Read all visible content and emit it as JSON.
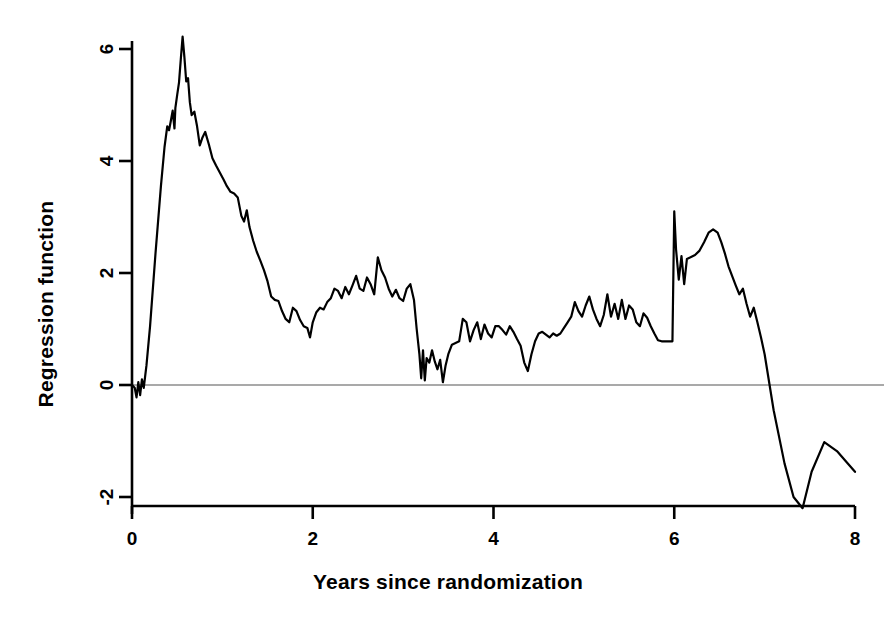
{
  "chart_data": {
    "type": "line",
    "title": "",
    "subtitle": "",
    "xlabel": "Years since randomization",
    "ylabel": "Regression function",
    "xlim": [
      0,
      8
    ],
    "ylim": [
      -2.45,
      6.45
    ],
    "xticks": [
      0,
      2,
      4,
      6,
      8
    ],
    "xtick_labels": [
      "0",
      "2",
      "4",
      "6",
      "8"
    ],
    "yticks": [
      -2,
      0,
      2,
      4,
      6
    ],
    "ytick_labels": [
      "-2",
      "0",
      "2",
      "4",
      "6"
    ],
    "grid": false,
    "legend": null,
    "legend_position": "none",
    "annotations": [
      {
        "text": "horizontal reference line at y = 0",
        "y": 0
      }
    ],
    "reference_lines": [
      {
        "orientation": "horizontal",
        "value": 0,
        "color": "#555555",
        "width": 1
      }
    ],
    "series": [
      {
        "name": "Regression function",
        "color": "#000000",
        "line_width": 2.2,
        "x": [
          0.0,
          0.03,
          0.05,
          0.07,
          0.09,
          0.11,
          0.13,
          0.16,
          0.2,
          0.26,
          0.32,
          0.36,
          0.39,
          0.41,
          0.43,
          0.45,
          0.47,
          0.48,
          0.5,
          0.52,
          0.54,
          0.56,
          0.58,
          0.6,
          0.62,
          0.64,
          0.66,
          0.69,
          0.72,
          0.75,
          0.78,
          0.81,
          0.85,
          0.89,
          0.93,
          0.97,
          1.01,
          1.05,
          1.09,
          1.13,
          1.17,
          1.21,
          1.24,
          1.27,
          1.3,
          1.34,
          1.38,
          1.42,
          1.46,
          1.5,
          1.54,
          1.58,
          1.62,
          1.66,
          1.7,
          1.74,
          1.78,
          1.82,
          1.86,
          1.9,
          1.94,
          1.97,
          2.0,
          2.04,
          2.08,
          2.12,
          2.16,
          2.2,
          2.24,
          2.28,
          2.32,
          2.36,
          2.4,
          2.44,
          2.48,
          2.52,
          2.56,
          2.6,
          2.64,
          2.68,
          2.72,
          2.76,
          2.8,
          2.84,
          2.88,
          2.92,
          2.96,
          3.0,
          3.04,
          3.08,
          3.12,
          3.15,
          3.18,
          3.2,
          3.22,
          3.24,
          3.26,
          3.29,
          3.32,
          3.35,
          3.38,
          3.41,
          3.44,
          3.47,
          3.5,
          3.54,
          3.58,
          3.62,
          3.66,
          3.7,
          3.74,
          3.78,
          3.82,
          3.86,
          3.9,
          3.94,
          3.98,
          4.02,
          4.06,
          4.1,
          4.14,
          4.18,
          4.22,
          4.26,
          4.3,
          4.34,
          4.38,
          4.42,
          4.46,
          4.5,
          4.54,
          4.58,
          4.62,
          4.66,
          4.7,
          4.74,
          4.78,
          4.82,
          4.86,
          4.9,
          4.94,
          4.98,
          5.02,
          5.06,
          5.1,
          5.14,
          5.18,
          5.22,
          5.26,
          5.3,
          5.34,
          5.38,
          5.42,
          5.46,
          5.5,
          5.54,
          5.58,
          5.62,
          5.66,
          5.7,
          5.74,
          5.78,
          5.82,
          5.86,
          5.9,
          5.94,
          5.98,
          6.0,
          6.02,
          6.05,
          6.08,
          6.11,
          6.14,
          6.18,
          6.23,
          6.28,
          6.33,
          6.38,
          6.43,
          6.48,
          6.52,
          6.56,
          6.6,
          6.64,
          6.68,
          6.72,
          6.76,
          6.8,
          6.84,
          6.88,
          6.92,
          6.96,
          7.0,
          7.1,
          7.22,
          7.32,
          7.42,
          7.52,
          7.66,
          7.8,
          7.92,
          8.0
        ],
        "y": [
          0.0,
          -0.05,
          -0.22,
          0.05,
          -0.18,
          0.1,
          -0.05,
          0.35,
          1.05,
          2.35,
          3.55,
          4.25,
          4.62,
          4.55,
          4.72,
          4.9,
          4.58,
          4.95,
          5.18,
          5.4,
          5.82,
          6.22,
          5.85,
          5.42,
          5.48,
          5.05,
          4.82,
          4.88,
          4.62,
          4.28,
          4.42,
          4.52,
          4.3,
          4.05,
          3.92,
          3.8,
          3.68,
          3.55,
          3.45,
          3.42,
          3.35,
          3.02,
          2.92,
          3.12,
          2.82,
          2.58,
          2.38,
          2.22,
          2.05,
          1.85,
          1.58,
          1.52,
          1.5,
          1.32,
          1.18,
          1.12,
          1.38,
          1.32,
          1.16,
          1.05,
          1.02,
          0.85,
          1.12,
          1.3,
          1.38,
          1.35,
          1.48,
          1.55,
          1.72,
          1.68,
          1.55,
          1.75,
          1.62,
          1.78,
          1.95,
          1.72,
          1.68,
          1.92,
          1.8,
          1.62,
          2.28,
          2.05,
          1.92,
          1.72,
          1.58,
          1.7,
          1.55,
          1.5,
          1.72,
          1.8,
          1.52,
          1.0,
          0.55,
          0.12,
          0.62,
          0.08,
          0.48,
          0.4,
          0.62,
          0.42,
          0.28,
          0.45,
          0.05,
          0.35,
          0.55,
          0.72,
          0.75,
          0.78,
          1.18,
          1.12,
          0.78,
          0.98,
          1.12,
          0.82,
          1.08,
          0.92,
          0.85,
          1.05,
          1.05,
          0.98,
          0.9,
          1.05,
          0.95,
          0.82,
          0.7,
          0.4,
          0.25,
          0.55,
          0.78,
          0.92,
          0.95,
          0.9,
          0.85,
          0.92,
          0.88,
          0.92,
          1.02,
          1.12,
          1.22,
          1.48,
          1.32,
          1.22,
          1.42,
          1.58,
          1.35,
          1.18,
          1.05,
          1.25,
          1.62,
          1.22,
          1.45,
          1.18,
          1.52,
          1.18,
          1.42,
          1.35,
          1.12,
          1.05,
          1.28,
          1.2,
          1.05,
          0.92,
          0.8,
          0.78,
          0.78,
          0.78,
          0.78,
          3.1,
          2.42,
          1.88,
          2.3,
          1.8,
          2.25,
          2.28,
          2.32,
          2.4,
          2.55,
          2.72,
          2.78,
          2.72,
          2.55,
          2.35,
          2.12,
          1.95,
          1.78,
          1.62,
          1.72,
          1.45,
          1.22,
          1.38,
          1.12,
          0.85,
          0.55,
          -0.45,
          -1.4,
          -2.0,
          -2.2,
          -1.55,
          -1.02,
          -1.18,
          -1.4,
          -1.55
        ]
      }
    ]
  },
  "figure": {
    "background": "#ffffff",
    "foreground": "#000000",
    "axis_color": "#000000",
    "reference_line_color": "#555555"
  }
}
